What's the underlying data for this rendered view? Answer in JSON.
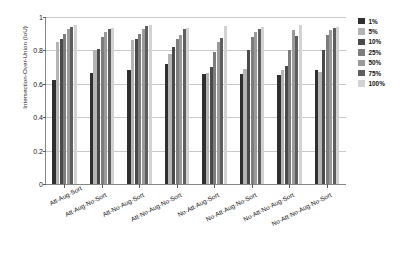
{
  "chart_data": {
    "type": "bar",
    "title": "",
    "subtitle": "",
    "xlabel": "",
    "ylabel": "Intersection-Over-Union (IoU)",
    "ylim": [
      0,
      1
    ],
    "yticks": [
      0,
      0.2,
      0.4,
      0.6,
      0.8,
      1
    ],
    "ytick_labels": [
      "0",
      "0.2",
      "0.4",
      "0.6",
      "0.8",
      "1"
    ],
    "grid": true,
    "grid_axis": "y",
    "legend_position": "right",
    "categories": [
      "Att-Aug-Sort",
      "Att-Aug-No-Sort",
      "Att-No-Aug-Sort",
      "Att-No-Aug-No-Sort",
      "No-Att-Aug-Sort",
      "No-Att-Aug-No-Sort",
      "No-Att-No-Aug-Sort",
      "No-Att-No-Aug-No-Sort"
    ],
    "series": [
      {
        "name": "1%",
        "color": "#2f2f2f",
        "values": [
          0.62,
          0.665,
          0.685,
          0.72,
          0.66,
          0.66,
          0.655,
          0.685
        ]
      },
      {
        "name": "5%",
        "color": "#b4b4b4",
        "values": [
          0.85,
          0.8,
          0.86,
          0.78,
          0.665,
          0.69,
          0.68,
          0.67
        ]
      },
      {
        "name": "10%",
        "color": "#4a4a4a",
        "values": [
          0.87,
          0.81,
          0.87,
          0.82,
          0.7,
          0.8,
          0.705,
          0.8
        ]
      },
      {
        "name": "25%",
        "color": "#7d7d7d",
        "values": [
          0.9,
          0.88,
          0.9,
          0.87,
          0.79,
          0.88,
          0.8,
          0.89
        ]
      },
      {
        "name": "50%",
        "color": "#9a9a9a",
        "values": [
          0.93,
          0.91,
          0.93,
          0.89,
          0.85,
          0.91,
          0.92,
          0.92
        ]
      },
      {
        "name": "75%",
        "color": "#5e5e5e",
        "values": [
          0.94,
          0.93,
          0.945,
          0.93,
          0.875,
          0.93,
          0.885,
          0.935
        ]
      },
      {
        "name": "100%",
        "color": "#d2d2d2",
        "values": [
          0.95,
          0.935,
          0.955,
          0.935,
          0.945,
          0.94,
          0.955,
          0.94
        ]
      }
    ]
  },
  "axis": {
    "line_color": "#868686",
    "grid_color": "#c9c9c9",
    "text_color": "#141414"
  }
}
